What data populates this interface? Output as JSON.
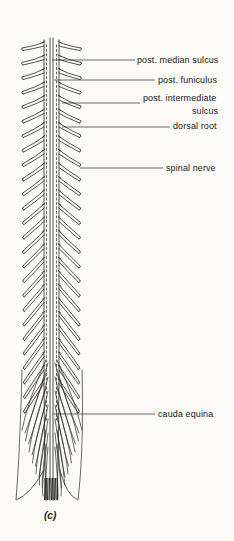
{
  "figure": {
    "caption": "(c)",
    "line_color": "#2a2a2a",
    "background": "#fbfaf6"
  },
  "labels": [
    {
      "id": "post-median-sulcus",
      "text": "post. median sulcus",
      "x": 137,
      "y": 55,
      "leader": {
        "x1": 52,
        "y1": 60,
        "x2": 135,
        "y2": 60
      }
    },
    {
      "id": "post-funiculus",
      "text": "post. funiculus",
      "x": 158,
      "y": 75,
      "leader": {
        "x1": 54,
        "y1": 80,
        "x2": 155,
        "y2": 80
      }
    },
    {
      "id": "post-intermediate-sulcus",
      "text": "post. intermediate",
      "text2": "sulcus",
      "x": 143,
      "y": 93,
      "leader": {
        "x1": 62,
        "y1": 103,
        "x2": 140,
        "y2": 103
      }
    },
    {
      "id": "dorsal-root",
      "text": "dorsal root",
      "x": 173,
      "y": 121,
      "leader": {
        "x1": 62,
        "y1": 127,
        "x2": 170,
        "y2": 127
      }
    },
    {
      "id": "spinal-nerve",
      "text": "spinal nerve",
      "x": 166,
      "y": 163,
      "leader": {
        "x1": 80,
        "y1": 168,
        "x2": 163,
        "y2": 168
      }
    },
    {
      "id": "cauda-equina",
      "text": "cauda equina",
      "x": 158,
      "y": 409,
      "leader": {
        "x1": 52,
        "y1": 414,
        "x2": 155,
        "y2": 414
      }
    }
  ]
}
